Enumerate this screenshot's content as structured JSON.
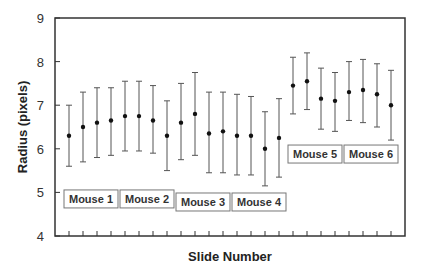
{
  "chart_data": {
    "type": "scatter",
    "subtype": "error_bar",
    "title": "",
    "xlabel": "Slide Number",
    "ylabel": "Radius (pixels)",
    "ylim": [
      4,
      9
    ],
    "yticks": [
      4,
      5,
      6,
      7,
      8,
      9
    ],
    "grid": false,
    "legend": null,
    "x": [
      1,
      2,
      3,
      4,
      5,
      6,
      7,
      8,
      9,
      10,
      11,
      12,
      13,
      14,
      15,
      16,
      17,
      18,
      19,
      20,
      21,
      22,
      23,
      24
    ],
    "series": [
      {
        "name": "Radius",
        "values": [
          6.3,
          6.5,
          6.6,
          6.65,
          6.75,
          6.75,
          6.65,
          6.3,
          6.6,
          6.8,
          6.35,
          6.4,
          6.3,
          6.3,
          6.0,
          6.25,
          7.45,
          7.55,
          7.15,
          7.1,
          7.3,
          7.35,
          7.25,
          7.0
        ],
        "lower": [
          5.6,
          5.7,
          5.8,
          5.85,
          5.95,
          5.95,
          5.9,
          5.5,
          5.75,
          5.85,
          5.45,
          5.45,
          5.4,
          5.4,
          5.15,
          5.35,
          6.8,
          6.9,
          6.45,
          6.4,
          6.65,
          6.6,
          6.5,
          6.2
        ],
        "upper": [
          7.0,
          7.3,
          7.4,
          7.4,
          7.55,
          7.55,
          7.45,
          7.1,
          7.5,
          7.75,
          7.3,
          7.3,
          7.25,
          7.2,
          6.85,
          7.15,
          8.1,
          8.2,
          7.85,
          7.75,
          8.0,
          8.05,
          7.95,
          7.8
        ]
      }
    ],
    "annotations": [
      {
        "text": "Mouse 1",
        "slides": [
          1,
          4
        ],
        "y": 4.85
      },
      {
        "text": "Mouse 2",
        "slides": [
          5,
          8
        ],
        "y": 4.85
      },
      {
        "text": "Mouse 3",
        "slides": [
          9,
          12
        ],
        "y": 4.78
      },
      {
        "text": "Mouse 4",
        "slides": [
          13,
          16
        ],
        "y": 4.78
      },
      {
        "text": "Mouse 5",
        "slides": [
          17,
          20
        ],
        "y": 5.88
      },
      {
        "text": "Mouse 6",
        "slides": [
          21,
          24
        ],
        "y": 5.88
      }
    ]
  },
  "labels": {
    "y_ticks": [
      "4",
      "5",
      "6",
      "7",
      "8",
      "9"
    ],
    "x_title": "Slide Number",
    "y_title": "Radius (pixels)",
    "mouse_boxes": [
      "Mouse 1",
      "Mouse 2",
      "Mouse 3",
      "Mouse 4",
      "Mouse 5",
      "Mouse 6"
    ]
  },
  "colors": {
    "axis": "#333333",
    "errorbar": "#555555",
    "marker": "#111111",
    "box_border": "#777777"
  }
}
